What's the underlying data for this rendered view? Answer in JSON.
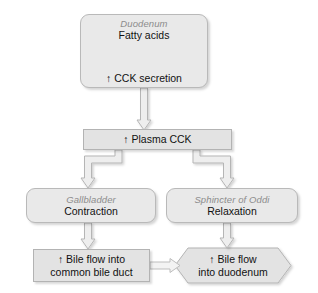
{
  "diagram": {
    "background_color": "#ffffff",
    "box_fill_color": "#e9e9e9",
    "box_border_color": "#b9b9b9",
    "organ_label_color": "#8c8c8c",
    "text_color": "#111111"
  },
  "nodes": {
    "duodenum": {
      "organ": "Duodenum",
      "stimulus": "Fatty acids",
      "response": "↑ CCK secretion",
      "shape": "rounded-rectangle"
    },
    "plasma": {
      "label": "↑ Plasma CCK",
      "shape": "rectangle"
    },
    "gallbladder": {
      "organ": "Gallbladder",
      "action": "Contraction",
      "shape": "rounded-rectangle"
    },
    "sphincter": {
      "organ": "Sphincter of Oddi",
      "action": "Relaxation",
      "shape": "rounded-rectangle"
    },
    "bile_duct_flow": {
      "line1": "↑ Bile flow into",
      "line2": "common bile duct",
      "shape": "rectangle"
    },
    "duodenum_flow": {
      "line1": "↑ Bile flow",
      "line2": "into duodenum",
      "shape": "hexagon"
    }
  },
  "connectors": [
    {
      "name": "fatty-acids-to-cck-secretion",
      "direction": "down",
      "style": "hollow-block-arrow"
    },
    {
      "name": "duodenum-to-plasma",
      "direction": "down",
      "style": "hollow-block-arrow"
    },
    {
      "name": "plasma-to-gallbladder",
      "direction": "down-left-elbow",
      "style": "hollow-block-arrow"
    },
    {
      "name": "plasma-to-sphincter",
      "direction": "down-right-elbow",
      "style": "hollow-block-arrow"
    },
    {
      "name": "gallbladder-to-bile-duct",
      "direction": "down",
      "style": "hollow-block-arrow"
    },
    {
      "name": "sphincter-to-duodenum-flow",
      "direction": "down",
      "style": "hollow-block-arrow"
    },
    {
      "name": "bile-duct-to-duodenum-flow",
      "direction": "right",
      "style": "hollow-block-arrow"
    }
  ]
}
